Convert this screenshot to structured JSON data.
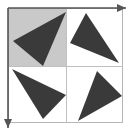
{
  "figure": {
    "title": "Four triangles arranged in a 2x2 grid with axis arrows",
    "width": 128,
    "height": 131,
    "background_color": "#ffffff"
  },
  "colors": {
    "triangle_fill": "#3a3a3a",
    "shaded_cell_fill": "#c9c9c9",
    "grid_line": "#c0c0c0",
    "frame_line": "#b5b5b5",
    "arrow_color": "#555555",
    "page_background": "#ffffff"
  },
  "grid": {
    "left": 8,
    "top": 8,
    "right": 122,
    "bottom": 122,
    "mid_x": 66,
    "mid_y": 66,
    "rows": 2,
    "columns": 2,
    "line_width": 1
  },
  "shaded_cell": {
    "name": "top-left-cell",
    "x": 8,
    "y": 8,
    "width": 58,
    "height": 58,
    "fill": "#c9c9c9"
  },
  "arrows": [
    {
      "name": "horizontal-axis-arrow",
      "direction": "right",
      "x1": 8,
      "y1": 8,
      "x2": 126,
      "y2": 8,
      "head_points": "126,8 117,4 117,12"
    },
    {
      "name": "vertical-axis-arrow",
      "direction": "down",
      "x1": 8,
      "y1": 8,
      "x2": 8,
      "y2": 128,
      "head_points": "8,128 4,119 12,119"
    }
  ],
  "triangles": [
    {
      "name": "triangle-top-left",
      "cell": "top-left",
      "points": "66,12 13,41 43,66",
      "fill": "#3a3a3a"
    },
    {
      "name": "triangle-top-right",
      "cell": "top-right",
      "points": "86,13 70,43 119,63",
      "fill": "#3a3a3a"
    },
    {
      "name": "triangle-bottom-left",
      "cell": "bottom-left",
      "points": "12,69 66,95 43,119",
      "fill": "#3a3a3a"
    },
    {
      "name": "triangle-bottom-right",
      "cell": "bottom-right",
      "points": "97,71 122,96 78,121",
      "fill": "#3a3a3a"
    }
  ]
}
